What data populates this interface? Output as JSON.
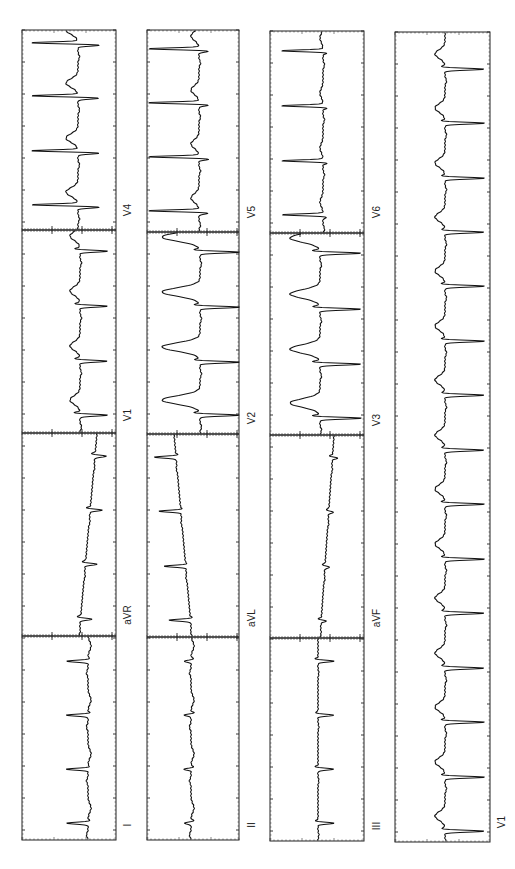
{
  "document": {
    "title": "12-lead ECG (rotated 90°)",
    "orientation": "rotated-90-ccw",
    "colors": {
      "trace": "#111111",
      "grid": "#222222",
      "background": "#ffffff"
    }
  },
  "strips": [
    {
      "id": "strip-1",
      "x": 22,
      "width": 94,
      "sections": [
        {
          "lead": "V4",
          "y0": 30,
          "y1": 230,
          "baseline": 78,
          "dir": 1,
          "qrs_pos": 22,
          "qrs_neg": -48,
          "t": -12,
          "beats": [
            44,
            97,
            152,
            206
          ],
          "drift": 0
        },
        {
          "lead": "V1",
          "y0": 230,
          "y1": 433,
          "baseline": 80,
          "dir": 1,
          "qrs_pos": 28,
          "qrs_neg": -6,
          "t": -10,
          "beats": [
            250,
            305,
            360,
            414
          ],
          "drift": 0
        },
        {
          "lead": "aVR",
          "y0": 433,
          "y1": 636,
          "baseline": 88,
          "dir": 1,
          "qrs_pos": 12,
          "qrs_neg": -4,
          "t": 0,
          "beats": [
            455,
            509,
            563,
            618
          ],
          "drift": -18
        },
        {
          "lead": "I",
          "y0": 636,
          "y1": 840,
          "baseline": 88,
          "dir": -1,
          "qrs_pos": 22,
          "qrs_neg": -2,
          "t": -3,
          "beats": [
            660,
            714,
            768,
            822
          ],
          "drift": 0
        }
      ],
      "labels": [
        {
          "text": "V4",
          "x": 128,
          "y": 210
        },
        {
          "text": "V1",
          "x": 128,
          "y": 415
        },
        {
          "text": "aVR",
          "x": 128,
          "y": 615
        },
        {
          "text": "I",
          "x": 128,
          "y": 825
        }
      ]
    },
    {
      "id": "strip-2",
      "x": 147,
      "width": 92,
      "sections": [
        {
          "lead": "V5",
          "y0": 30,
          "y1": 232,
          "baseline": 199,
          "dir": 1,
          "qrs_pos": 10,
          "qrs_neg": -52,
          "t": -8,
          "beats": [
            50,
            104,
            158,
            212
          ],
          "drift": 0
        },
        {
          "lead": "V2",
          "y0": 232,
          "y1": 434,
          "baseline": 200,
          "dir": 1,
          "qrs_pos": 40,
          "qrs_neg": -6,
          "t": -38,
          "beats": [
            251,
            306,
            361,
            414
          ],
          "drift": 0
        },
        {
          "lead": "aVL",
          "y0": 434,
          "y1": 637,
          "baseline": 183,
          "dir": -1,
          "qrs_pos": 22,
          "qrs_neg": -2,
          "t": 0,
          "beats": [
            456,
            510,
            565,
            619
          ],
          "drift": 18
        },
        {
          "lead": "II",
          "y0": 637,
          "y1": 840,
          "baseline": 191,
          "dir": -1,
          "qrs_pos": 7,
          "qrs_neg": -3,
          "t": -3,
          "beats": [
            660,
            714,
            768,
            822
          ],
          "drift": 0
        }
      ],
      "labels": [
        {
          "text": "V5",
          "x": 252,
          "y": 212
        },
        {
          "text": "V2",
          "x": 252,
          "y": 418
        },
        {
          "text": "aVL",
          "x": 252,
          "y": 618
        },
        {
          "text": "II",
          "x": 252,
          "y": 825
        }
      ]
    },
    {
      "id": "strip-3",
      "x": 270,
      "width": 94,
      "sections": [
        {
          "lead": "V6",
          "y0": 31,
          "y1": 233,
          "baseline": 323,
          "dir": 1,
          "qrs_pos": 4,
          "qrs_neg": -42,
          "t": -3,
          "beats": [
            52,
            107,
            162,
            216
          ],
          "drift": 0
        },
        {
          "lead": "V3",
          "y0": 233,
          "y1": 435,
          "baseline": 320,
          "dir": 1,
          "qrs_pos": 42,
          "qrs_neg": -8,
          "t": -30,
          "beats": [
            252,
            308,
            363,
            417
          ],
          "drift": 0
        },
        {
          "lead": "aVF",
          "y0": 435,
          "y1": 638,
          "baseline": 327,
          "dir": 1,
          "qrs_pos": 5,
          "qrs_neg": -3,
          "t": 0,
          "beats": [
            457,
            511,
            566,
            620
          ],
          "drift": -14
        },
        {
          "lead": "III",
          "y0": 638,
          "y1": 841,
          "baseline": 318,
          "dir": 1,
          "qrs_pos": 16,
          "qrs_neg": -3,
          "t": 0,
          "beats": [
            660,
            714,
            768,
            822
          ],
          "drift": 0
        }
      ],
      "labels": [
        {
          "text": "V6",
          "x": 377,
          "y": 212
        },
        {
          "text": "V3",
          "x": 377,
          "y": 420
        },
        {
          "text": "aVF",
          "x": 377,
          "y": 618
        },
        {
          "text": "III",
          "x": 377,
          "y": 826
        }
      ]
    },
    {
      "id": "strip-4-rhythm",
      "x": 395,
      "width": 95,
      "sections": [
        {
          "lead": "V1",
          "y0": 32,
          "y1": 842,
          "baseline": 445,
          "dir": 1,
          "qrs_pos": 40,
          "qrs_neg": -4,
          "t": -10,
          "beats": [
            68,
            122,
            177,
            231,
            285,
            340,
            394,
            449,
            503,
            558,
            612,
            667,
            721,
            776,
            830
          ],
          "drift": 0
        }
      ],
      "labels": [
        {
          "text": "V1",
          "x": 502,
          "y": 822
        }
      ]
    }
  ]
}
